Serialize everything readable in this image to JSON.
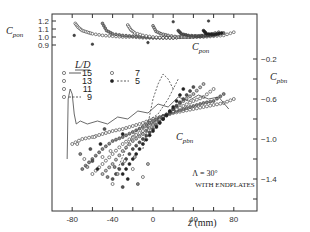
{
  "chart_data": {
    "type": "scatter",
    "title": "",
    "xlabel": "z (mm)",
    "x_ticks": [
      -80,
      -40,
      0,
      40,
      80
    ],
    "xlim": [
      -100,
      100
    ],
    "left_axis": {
      "label": "C_pon",
      "label_main": "C",
      "label_sub": "pon",
      "ticks": [
        1.2,
        1.1,
        1.0,
        0.9
      ],
      "range": [
        0.9,
        1.2
      ]
    },
    "right_axis": {
      "label": "C_pbn",
      "label_main": "C",
      "label_sub": "pbn",
      "ticks": [
        -0.2,
        -0.6,
        -1.0,
        -1.4
      ],
      "range": [
        -1.6,
        0.0
      ]
    },
    "annotations": {
      "angle": "Λ = 30°",
      "config": "WITH ENDPLATES",
      "curve_label_top": "C_pon",
      "curve_label_bottom": "C_pbn"
    },
    "legend": {
      "title": "L/D",
      "entries": [
        {
          "value": "15",
          "marker": "open-circle",
          "line": "solid"
        },
        {
          "value": "13",
          "marker": "open-circle",
          "line": "none"
        },
        {
          "value": "11",
          "marker": "open-circle",
          "line": "none"
        },
        {
          "value": "9",
          "marker": "open-circle",
          "line": "dashed"
        },
        {
          "value": "7",
          "marker": "open-circle",
          "line": "none"
        },
        {
          "value": "5",
          "marker": "filled-circle",
          "line": "dashed"
        }
      ]
    },
    "series_cpon": [
      {
        "name": "L/D=15",
        "peak_z": -75,
        "x": [
          -77,
          -74,
          -70,
          -65,
          -60,
          -50,
          -40,
          -30,
          -20,
          -10,
          0,
          10,
          20,
          30,
          40,
          50,
          60,
          70,
          80
        ],
        "y": [
          1.17,
          1.12,
          1.08,
          1.06,
          1.04,
          1.02,
          1.01,
          1.0,
          1.0,
          0.99,
          0.99,
          0.99,
          0.99,
          1.0,
          1.0,
          1.0,
          1.01,
          1.02,
          1.06
        ]
      },
      {
        "name": "L/D=13",
        "peak_z": -50,
        "x": [
          -50,
          -46,
          -40,
          -30,
          -20,
          -10,
          0,
          10,
          20,
          30,
          40,
          50,
          60,
          70
        ],
        "y": [
          1.17,
          1.08,
          1.04,
          1.02,
          1.01,
          1.0,
          0.99,
          0.99,
          0.99,
          1.0,
          1.0,
          1.01,
          1.02,
          1.05
        ]
      },
      {
        "name": "L/D=11",
        "peak_z": -25,
        "x": [
          -25,
          -22,
          -18,
          -10,
          0,
          10,
          20,
          30,
          40,
          50,
          60
        ],
        "y": [
          1.15,
          1.09,
          1.05,
          1.02,
          1.0,
          0.99,
          0.99,
          1.0,
          1.01,
          1.02,
          1.04
        ]
      },
      {
        "name": "L/D=9",
        "peak_z": 0,
        "x": [
          0,
          3,
          8,
          15,
          25,
          35,
          45,
          55,
          65
        ],
        "y": [
          1.14,
          1.07,
          1.04,
          1.02,
          1.0,
          1.0,
          1.01,
          1.03,
          1.06
        ]
      },
      {
        "name": "L/D=7",
        "peak_z": 25,
        "x": [
          25,
          28,
          35,
          45,
          55,
          65
        ],
        "y": [
          1.08,
          1.04,
          1.02,
          1.01,
          1.02,
          1.04
        ]
      },
      {
        "name": "L/D=5",
        "peak_z": 50,
        "x": [
          50,
          53,
          60,
          68
        ],
        "y": [
          1.08,
          1.04,
          1.03,
          1.05
        ]
      }
    ],
    "series_cpbn": [
      {
        "name": "L/D=15",
        "x": [
          -80,
          -70,
          -60,
          -50,
          -40,
          -30,
          -20,
          -10,
          0,
          10,
          20,
          30,
          40,
          50,
          60,
          70,
          80
        ],
        "y": [
          -1.05,
          -1.0,
          -0.98,
          -0.95,
          -0.92,
          -0.9,
          -0.87,
          -0.84,
          -0.8,
          -0.77,
          -0.74,
          -0.72,
          -0.7,
          -0.68,
          -0.66,
          -0.64,
          -0.6
        ]
      },
      {
        "name": "L/D=13",
        "x": [
          -70,
          -60,
          -50,
          -40,
          -30,
          -20,
          -10,
          0,
          10,
          20,
          30,
          40,
          50,
          60,
          70
        ],
        "y": [
          -1.3,
          -1.2,
          -1.1,
          -1.02,
          -0.98,
          -0.93,
          -0.88,
          -0.82,
          -0.77,
          -0.73,
          -0.7,
          -0.67,
          -0.64,
          -0.62,
          -0.55
        ]
      },
      {
        "name": "L/D=11",
        "x": [
          -60,
          -50,
          -40,
          -30,
          -20,
          -10,
          0,
          10,
          20,
          30,
          40,
          50,
          60
        ],
        "y": [
          -1.35,
          -1.25,
          -1.15,
          -1.05,
          -0.98,
          -0.92,
          -0.85,
          -0.78,
          -0.72,
          -0.67,
          -0.62,
          -0.58,
          -0.5
        ]
      },
      {
        "name": "L/D=9",
        "x": [
          -50,
          -40,
          -30,
          -20,
          -10,
          0,
          10,
          20,
          30,
          40,
          50
        ],
        "y": [
          -1.35,
          -1.25,
          -1.12,
          -1.02,
          -0.95,
          -0.86,
          -0.78,
          -0.7,
          -0.62,
          -0.55,
          -0.45
        ]
      },
      {
        "name": "L/D=7",
        "x": [
          -40,
          -30,
          -20,
          -10,
          0,
          10,
          20,
          30,
          40
        ],
        "y": [
          -1.4,
          -1.25,
          -1.1,
          -1.0,
          -0.9,
          -0.8,
          -0.7,
          -0.6,
          -0.48
        ]
      },
      {
        "name": "L/D=5",
        "x": [
          -30,
          -20,
          -10,
          0,
          10,
          20,
          30
        ],
        "y": [
          -1.35,
          -1.2,
          -1.05,
          -0.92,
          -0.8,
          -0.68,
          -0.5
        ]
      }
    ],
    "line_traces": [
      {
        "name": "L/D=15 solid",
        "style": "solid",
        "x": [
          -85,
          -84,
          -82,
          -80,
          -78,
          -76,
          -72,
          -65,
          -55,
          -45,
          -35,
          -25,
          -15,
          -5,
          5,
          15,
          25,
          35,
          45,
          55,
          65,
          75
        ],
        "y": [
          -1.2,
          -0.6,
          -0.5,
          -0.55,
          -0.75,
          -0.85,
          -0.82,
          -0.85,
          -0.82,
          -0.85,
          -0.78,
          -0.8,
          -0.72,
          -0.74,
          -0.65,
          -0.68,
          -0.58,
          -0.62,
          -0.56,
          -0.6,
          -0.58,
          -0.7
        ]
      },
      {
        "name": "L/D=9 dashed",
        "style": "dashed",
        "x": [
          -35,
          -25,
          -15,
          -5,
          5,
          15,
          25
        ],
        "y": [
          -1.3,
          -1.05,
          -0.9,
          -0.82,
          -0.75,
          -0.6,
          -0.4
        ]
      },
      {
        "name": "L/D=5 dashed",
        "style": "dashed",
        "x": [
          -10,
          -5,
          0,
          5,
          10,
          15,
          20
        ],
        "y": [
          -1.1,
          -0.85,
          -0.6,
          -0.45,
          -0.35,
          -0.4,
          -0.5
        ]
      }
    ],
    "grid": false,
    "legend_position": "upper-left (inside)"
  }
}
